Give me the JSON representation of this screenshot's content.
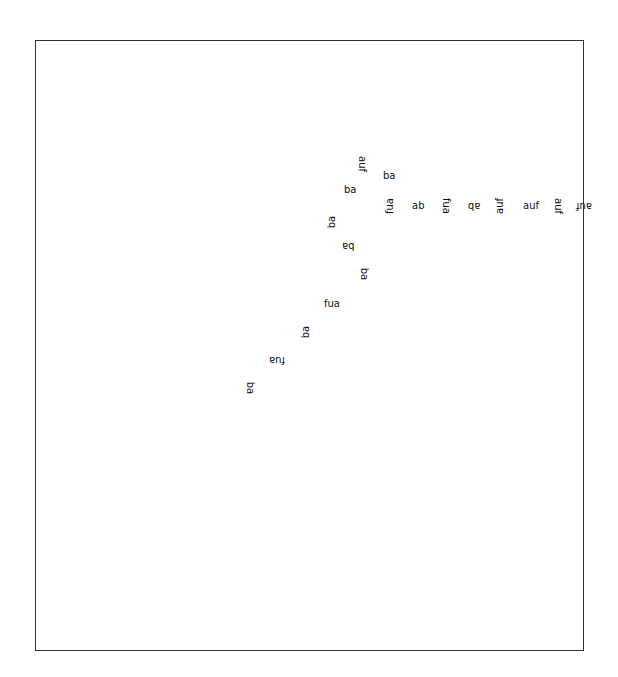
{
  "canvas": {
    "border_color": "#333333",
    "text_color": "#111111"
  },
  "labels": [
    {
      "text": "auf",
      "rotation_deg": 90
    },
    {
      "text": "ba",
      "rotation_deg": 0
    },
    {
      "text": "ba",
      "rotation_deg": 0
    },
    {
      "text": "fua",
      "rotation_deg": 270
    },
    {
      "text": "ab",
      "rotation_deg": 0
    },
    {
      "text": "fua",
      "rotation_deg": 90
    },
    {
      "text": "ab",
      "rotation_deg": 180
    },
    {
      "text": "auf",
      "rotation_deg": 270
    },
    {
      "text": "auf",
      "rotation_deg": 0
    },
    {
      "text": "auf",
      "rotation_deg": 90
    },
    {
      "text": "auf",
      "rotation_deg": 180
    },
    {
      "text": "ba",
      "rotation_deg": 270
    },
    {
      "text": "ba",
      "rotation_deg": 180
    },
    {
      "text": "ba",
      "rotation_deg": 90
    },
    {
      "text": "fua",
      "rotation_deg": 0
    },
    {
      "text": "ba",
      "rotation_deg": 270
    },
    {
      "text": "fua",
      "rotation_deg": 180
    },
    {
      "text": "ba",
      "rotation_deg": 90
    }
  ]
}
